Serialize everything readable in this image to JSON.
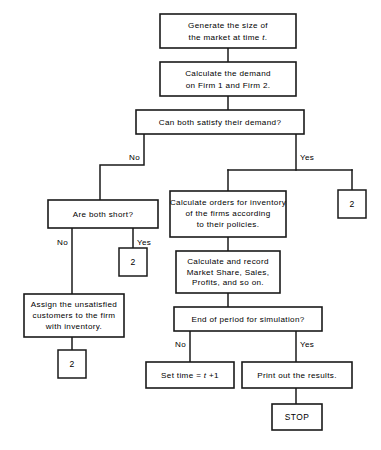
{
  "diagram": {
    "background_color": "#ffffff",
    "line_color": "#1a1a1a",
    "text_color": "#000000"
  },
  "nodes": {
    "generate_market": {
      "type": "process",
      "lines": [
        "Generate  the  size  of",
        "the  market  at  time"
      ],
      "variable": "t",
      "trailing": "."
    },
    "calculate_demand": {
      "type": "process",
      "lines": [
        "Calculate  the  demand",
        "on  Firm  1  and  Firm  2."
      ]
    },
    "can_both_satisfy": {
      "type": "decision",
      "lines": [
        "Can  both  satisfy  their  demand?"
      ]
    },
    "are_both_short": {
      "type": "decision",
      "lines": [
        "Are  both  short?"
      ]
    },
    "calculate_orders": {
      "type": "process",
      "lines": [
        "Calculate  orders  for  inventory",
        "of  the  firms  according",
        "to  their  policies."
      ]
    },
    "calculate_record": {
      "type": "process",
      "lines": [
        "Calculate  and  record",
        "Market  Share,  Sales,",
        "Profits,  and  so  on."
      ]
    },
    "assign_customers": {
      "type": "process",
      "lines": [
        "Assign  the  unsatisfied",
        "customers  to  the  firm",
        "with  inventory."
      ]
    },
    "end_of_period": {
      "type": "decision",
      "lines": [
        "End  of  period  for  simulation?"
      ]
    },
    "set_time": {
      "type": "process",
      "prefix": "Set  time  =  ",
      "variable": "t",
      "suffix": " +1"
    },
    "print_results": {
      "type": "process",
      "lines": [
        "Print  out  the  results."
      ]
    },
    "stop": {
      "type": "terminal",
      "label": "STOP"
    }
  },
  "connectors": {
    "connector_right": {
      "label": "2"
    },
    "connector_short_yes": {
      "label": "2"
    },
    "connector_assign": {
      "label": "2"
    }
  },
  "branch_labels": {
    "satisfy_no": "No",
    "satisfy_yes": "Yes",
    "short_no": "No",
    "short_yes": "Yes",
    "period_no": "No",
    "period_yes": "Yes"
  }
}
